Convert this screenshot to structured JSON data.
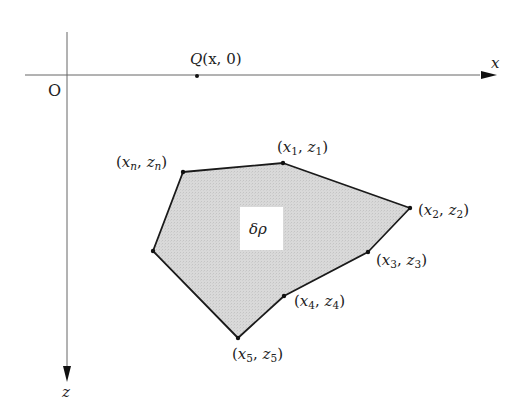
{
  "diagram": {
    "origin_label": "O",
    "x_axis_label": "x",
    "z_axis_label": "z",
    "point_q": {
      "label_prefix": "Q",
      "label_args": "(x, 0)",
      "pos": [
        197,
        76
      ]
    },
    "region_label": "δρ",
    "colors": {
      "fill": "#d6d6d6",
      "edge": "#1a1a1a",
      "axis": "#555555",
      "region_label_bg": "#ffffff"
    },
    "vertices": [
      {
        "name": "n",
        "label": "(x_n, z_n)",
        "var": "x",
        "sub": "n",
        "var2": "z",
        "sub2": "n",
        "pos": [
          183,
          172
        ]
      },
      {
        "name": "1",
        "label": "(x_1, z_1)",
        "var": "x",
        "sub": "1",
        "var2": "z",
        "sub2": "1",
        "pos": [
          283,
          163
        ]
      },
      {
        "name": "2",
        "label": "(x_2, z_2)",
        "var": "x",
        "sub": "2",
        "var2": "z",
        "sub2": "2",
        "pos": [
          410,
          208
        ]
      },
      {
        "name": "3",
        "label": "(x_3, z_3)",
        "var": "x",
        "sub": "3",
        "var2": "z",
        "sub2": "3",
        "pos": [
          368,
          252
        ]
      },
      {
        "name": "4",
        "label": "(x_4, z_4)",
        "var": "x",
        "sub": "4",
        "var2": "z",
        "sub2": "4",
        "pos": [
          284,
          296
        ]
      },
      {
        "name": "5",
        "label": "(x_5, z_5)",
        "var": "x",
        "sub": "5",
        "var2": "z",
        "sub2": "5",
        "pos": [
          238,
          338
        ]
      },
      {
        "name": "left",
        "label": "",
        "pos": [
          153,
          251
        ]
      }
    ]
  }
}
